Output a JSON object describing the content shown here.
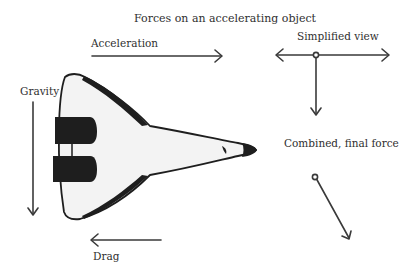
{
  "title": "Forces on an accelerating object",
  "labels": {
    "acceleration": "Acceleration",
    "gravity": "Gravity",
    "drag": "Drag",
    "simplified": "Simplified view",
    "combined": "Combined, final force"
  },
  "colors": {
    "arrow": "#3a3a3a",
    "shuttle_body": "#f2f2f2",
    "shuttle_dark": "#1e1e1e"
  }
}
